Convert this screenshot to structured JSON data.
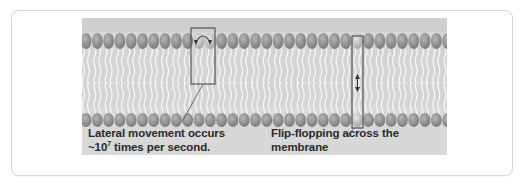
{
  "figure": {
    "colors": {
      "background": "#d8d8d8",
      "head": "#8e8e8e",
      "head_highlight": "#c9c9c9",
      "tail": "#f4f4f4",
      "box_stroke": "#5a5a5a",
      "text": "#2a2a2a"
    },
    "lateral_caption": {
      "line1": "Lateral movement occurs",
      "line2_prefix": "~10",
      "line2_sup": "7",
      "line2_suffix": " times per second."
    },
    "flipflop_caption": {
      "line1": "Flip-flopping across the membrane",
      "line2": "is rare (~ once per month)."
    }
  }
}
